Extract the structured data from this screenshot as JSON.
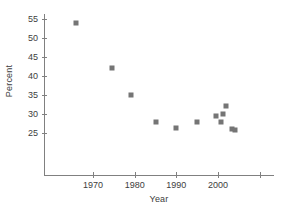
{
  "chart_data": {
    "type": "scatter",
    "title": "",
    "xlabel": "Year",
    "ylabel": "Percent",
    "xlim": [
      1962,
      2011
    ],
    "ylim": [
      21,
      57
    ],
    "grid": false,
    "legend": null,
    "marker_color": "#757575",
    "axis_color": "#808080",
    "text_color": "#3d3d3d",
    "xticks": [
      {
        "value": 1970,
        "label": "1970"
      },
      {
        "value": 1980,
        "label": "1980"
      },
      {
        "value": 1990,
        "label": "1990"
      },
      {
        "value": 2000,
        "label": "2000"
      },
      {
        "value": 2010,
        "label": ""
      }
    ],
    "yticks": [
      {
        "value": 55,
        "label": "55"
      },
      {
        "value": 50,
        "label": "50"
      },
      {
        "value": 45,
        "label": "45"
      },
      {
        "value": 40,
        "label": "40"
      },
      {
        "value": 35,
        "label": "35"
      },
      {
        "value": 30,
        "label": "30"
      },
      {
        "value": 25,
        "label": "25"
      }
    ],
    "series": [
      {
        "name": "Percent",
        "points": [
          {
            "x": 1966.0,
            "y": 54.0
          },
          {
            "x": 1974.5,
            "y": 42.0
          },
          {
            "x": 1979.0,
            "y": 35.0
          },
          {
            "x": 1985.0,
            "y": 28.0
          },
          {
            "x": 1990.0,
            "y": 26.4
          },
          {
            "x": 1995.0,
            "y": 27.8
          },
          {
            "x": 1999.5,
            "y": 29.5
          },
          {
            "x": 2000.6,
            "y": 28.0
          },
          {
            "x": 2001.2,
            "y": 30.1
          },
          {
            "x": 2002.0,
            "y": 32.2
          },
          {
            "x": 2003.4,
            "y": 26.1
          },
          {
            "x": 2004.0,
            "y": 25.7
          }
        ]
      }
    ]
  }
}
